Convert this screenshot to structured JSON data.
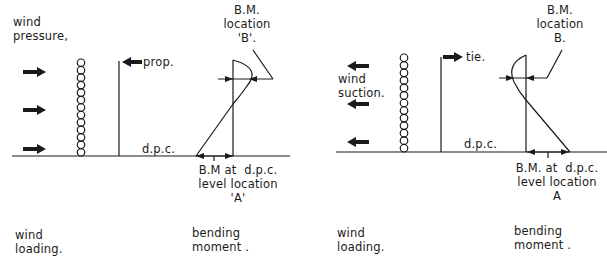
{
  "left_diagram": {
    "wind_label": "wind\npressure,",
    "prop_label": "prop.",
    "dpc_label": "d.p.c.",
    "bm_b_label": "B.M.\nlocation\n'B'.",
    "bm_a_label": "B.M at  d.p.c.\nlevel location\n'A'",
    "caption_loading": "wind\nloading.",
    "caption_moment": "bending\nmoment ."
  },
  "right_diagram": {
    "wind_label": "wind\nsuction.",
    "tie_label": "tie.",
    "dpc_label": "d.p.c.",
    "bm_b_label": "B.M.\nlocation\nB.",
    "bm_a_label": "B.M. at  d.p.c.\nlevel location\nA",
    "caption_loading": "wind\nloading.",
    "caption_moment": "bending\nmoment ."
  },
  "colors": {
    "ink": "#1a1a1a",
    "background": "#ffffff"
  }
}
